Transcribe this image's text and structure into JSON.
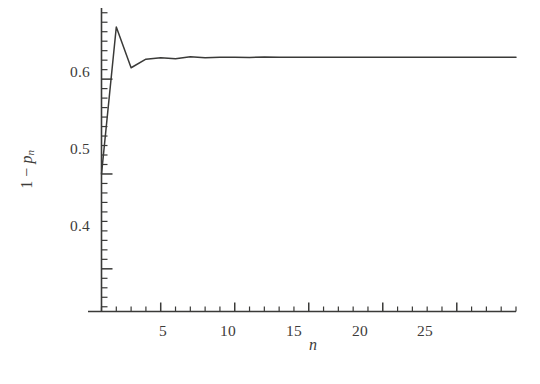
{
  "figure": {
    "background_color": "#ffffff",
    "line_color": "#3a3a38",
    "axis_color": "#3a3a38"
  },
  "axes": {
    "y": {
      "label_prefix": "1 − ",
      "label_var": "p",
      "label_sub": "n",
      "tick_labels": [
        "0.6",
        "0.5",
        "0.4"
      ],
      "tick_values": [
        0.6,
        0.5,
        0.4
      ]
    },
    "x": {
      "label": "n",
      "tick_labels": [
        "5",
        "10",
        "15",
        "20",
        "25"
      ],
      "tick_values": [
        5,
        10,
        15,
        20,
        25
      ]
    }
  },
  "chart_data": {
    "type": "line",
    "title": "",
    "subtitle": "",
    "xlabel": "n",
    "ylabel": "1 − p_n",
    "xlim": [
      1,
      29
    ],
    "ylim": [
      0.355,
      0.675
    ],
    "grid": false,
    "legend": null,
    "xticks": [
      5,
      10,
      15,
      20,
      25
    ],
    "yticks": [
      0.4,
      0.5,
      0.6
    ],
    "x_minor_tick_step": 1,
    "y_minor_tick_step": 0.01,
    "series": [
      {
        "name": "1 - p_n",
        "x": [
          1,
          2,
          3,
          4,
          5,
          6,
          7,
          8,
          9,
          10,
          11,
          12,
          13,
          14,
          15,
          16,
          17,
          18,
          19,
          20,
          21,
          22,
          23,
          24,
          25,
          26,
          27,
          28,
          29
        ],
        "values": [
          0.5,
          0.655,
          0.612,
          0.621,
          0.6225,
          0.6215,
          0.6235,
          0.6225,
          0.623,
          0.6232,
          0.6228,
          0.6234,
          0.623,
          0.6232,
          0.6231,
          0.6232,
          0.6231,
          0.6232,
          0.6232,
          0.6232,
          0.6232,
          0.6232,
          0.6232,
          0.6232,
          0.6232,
          0.6232,
          0.6232,
          0.6232,
          0.6232
        ]
      }
    ],
    "annotations": []
  }
}
